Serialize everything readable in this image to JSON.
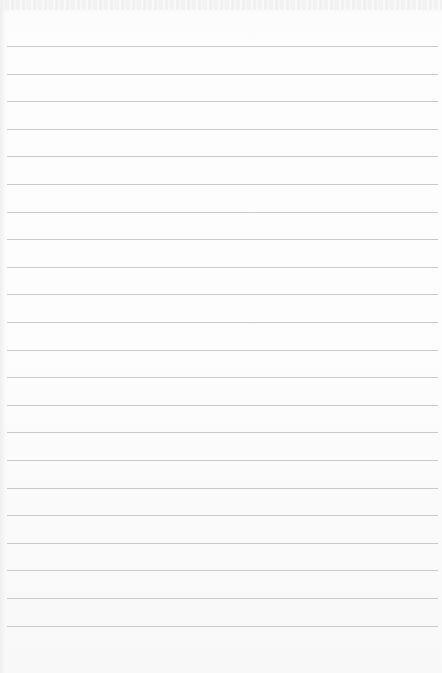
{
  "page": {
    "type": "lined-paper",
    "background_color": "#fbfbfb",
    "rule_color": "#c9c9c9",
    "rule_count": 22,
    "first_rule_y": 46,
    "rule_spacing": 27.6,
    "text": ""
  }
}
